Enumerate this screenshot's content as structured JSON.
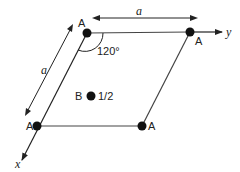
{
  "diagram": {
    "nodes": [
      {
        "id": "A_top_left",
        "label": "A",
        "x": 87,
        "y": 33
      },
      {
        "id": "A_top_right",
        "label": "A",
        "x": 190,
        "y": 32
      },
      {
        "id": "A_bottom_left",
        "label": "A",
        "x": 37,
        "y": 126
      },
      {
        "id": "A_bottom_right",
        "label": "A",
        "x": 142,
        "y": 126
      },
      {
        "id": "B_center",
        "label": "B",
        "height_label": "1/2",
        "x": 91,
        "y": 96
      }
    ],
    "angle_label": "120°",
    "lattice_param_top": "a",
    "lattice_param_left": "a",
    "axis_x_label": "x",
    "axis_y_label": "y"
  }
}
